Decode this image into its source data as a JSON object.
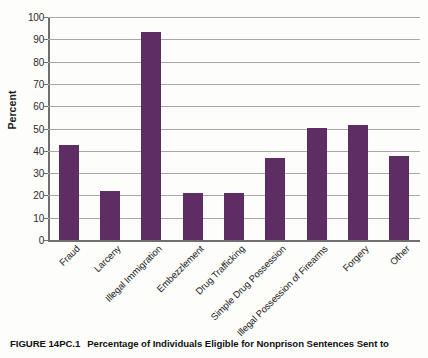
{
  "figure": {
    "number": "FIGURE 14PC.1",
    "caption": "Percentage of Individuals Eligible for Nonprison Sentences Sent to"
  },
  "chart_data": {
    "type": "bar",
    "title": "",
    "xlabel": "",
    "ylabel": "Percent",
    "ylim": [
      0,
      100
    ],
    "ytick_step": 10,
    "yticks": [
      "100",
      "90",
      "80",
      "70",
      "60",
      "50",
      "40",
      "30",
      "20",
      "10",
      "0"
    ],
    "grid": true,
    "legend": "none",
    "bar_color": "#5d2d63",
    "categories": [
      "Fraud",
      "Larceny",
      "Illegal Immigration",
      "Embezzlement",
      "Drug Trafficking",
      "Simple Drug Possession",
      "Illegal Possession of Firearms",
      "Forgery",
      "Other"
    ],
    "values": [
      42.5,
      22,
      93.5,
      21,
      21,
      37,
      50.3,
      51.5,
      37.7
    ]
  }
}
